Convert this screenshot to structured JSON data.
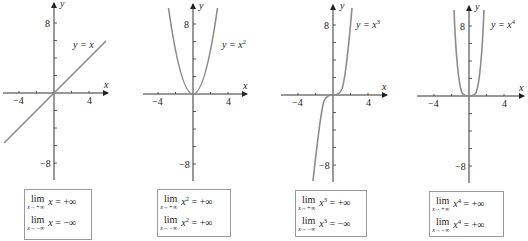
{
  "figure": {
    "panels": [
      {
        "id": "identity",
        "curve_label": {
          "prefix": "y = x",
          "exponent": ""
        },
        "axis": {
          "x_label": "x",
          "y_label": "y",
          "x_ticks": [
            "−4",
            "4"
          ],
          "y_ticks": [
            "8",
            "−8"
          ]
        },
        "limits": [
          {
            "op": "lim",
            "approach": "x→+∞",
            "base": "x",
            "exponent": "",
            "result": "= +∞"
          },
          {
            "op": "lim",
            "approach": "x→−∞",
            "base": "x",
            "exponent": "",
            "result": "= −∞"
          }
        ]
      },
      {
        "id": "square",
        "curve_label": {
          "prefix": "y = x",
          "exponent": "2"
        },
        "axis": {
          "x_label": "x",
          "y_label": "y",
          "x_ticks": [
            "−4",
            "4"
          ],
          "y_ticks": [
            "8",
            "−8"
          ]
        },
        "limits": [
          {
            "op": "lim",
            "approach": "x→+∞",
            "base": "x",
            "exponent": "2",
            "result": "= +∞"
          },
          {
            "op": "lim",
            "approach": "x→−∞",
            "base": "x",
            "exponent": "2",
            "result": "= +∞"
          }
        ]
      },
      {
        "id": "cube",
        "curve_label": {
          "prefix": "y = x",
          "exponent": "3"
        },
        "axis": {
          "x_label": "x",
          "y_label": "y",
          "x_ticks": [
            "−4",
            "4"
          ],
          "y_ticks": [
            "8",
            "−8"
          ]
        },
        "limits": [
          {
            "op": "lim",
            "approach": "x→+∞",
            "base": "x",
            "exponent": "3",
            "result": "= +∞"
          },
          {
            "op": "lim",
            "approach": "x→−∞",
            "base": "x",
            "exponent": "3",
            "result": "= −∞"
          }
        ]
      },
      {
        "id": "fourth",
        "curve_label": {
          "prefix": "y = x",
          "exponent": "4"
        },
        "axis": {
          "x_label": "x",
          "y_label": "y",
          "x_ticks": [
            "−4",
            "4"
          ],
          "y_ticks": [
            "8",
            "−8"
          ]
        },
        "limits": [
          {
            "op": "lim",
            "approach": "x→+∞",
            "base": "x",
            "exponent": "4",
            "result": "= +∞"
          },
          {
            "op": "lim",
            "approach": "x→−∞",
            "base": "x",
            "exponent": "4",
            "result": "= +∞"
          }
        ]
      }
    ],
    "colors": {
      "curve": "#8c8c8c",
      "axis": "#333333",
      "box_border": "#9a9a9a",
      "text": "#222222"
    }
  }
}
